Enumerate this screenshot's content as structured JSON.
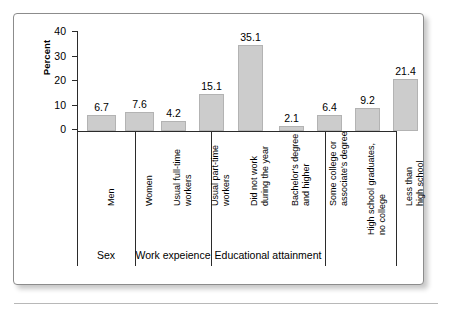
{
  "chart_data": {
    "type": "bar",
    "title": "",
    "xlabel": "",
    "ylabel": "Percent",
    "ylim": [
      0,
      40
    ],
    "yticks": [
      "0",
      "10",
      "20",
      "30",
      "40"
    ],
    "grid": false,
    "legend": "none",
    "categories": [
      "Men",
      "Women",
      "Usual full-time workers",
      "Usual part-time workers",
      "Did not work during the year",
      "Bachelor's degree and higher",
      "Some college or associate's degree",
      "High school graduates, no college",
      "Less than high school"
    ],
    "values": [
      6.7,
      7.6,
      4.2,
      15.1,
      35.1,
      2.1,
      6.4,
      9.2,
      21.4
    ],
    "bar_color": "#cccccc",
    "groups": [
      {
        "label": "Sex",
        "categories": [
          "Men",
          "Women"
        ]
      },
      {
        "label": "Work expeience",
        "categories": [
          "Usual full-time workers",
          "Usual part-time workers",
          "Did not work during the year"
        ]
      },
      {
        "label": "Educational attainment",
        "categories": [
          "Bachelor's degree and higher",
          "Some college or associate's degree",
          "High school graduates, no college",
          "Less than high school"
        ]
      }
    ]
  },
  "axis": {
    "y_title": "Percent",
    "ticks": [
      "40",
      "30",
      "20",
      "10",
      "0"
    ]
  },
  "bars": [
    {
      "value_label": "6.7",
      "line1": "Men",
      "line2": ""
    },
    {
      "value_label": "7.6",
      "line1": "Women",
      "line2": ""
    },
    {
      "value_label": "4.2",
      "line1": "Usual full-time",
      "line2": "workers"
    },
    {
      "value_label": "15.1",
      "line1": "Usual part-time",
      "line2": "workers"
    },
    {
      "value_label": "35.1",
      "line1": "Did not work",
      "line2": "during the year"
    },
    {
      "value_label": "2.1",
      "line1": "Bachelor's degree",
      "line2": "and higher"
    },
    {
      "value_label": "6.4",
      "line1": "Some college or",
      "line2": "associate's degree"
    },
    {
      "value_label": "9.2",
      "line1": "High school graduates,",
      "line2": "no college"
    },
    {
      "value_label": "21.4",
      "line1": "Less than",
      "line2": "high school"
    }
  ],
  "groups": [
    {
      "label": "Sex"
    },
    {
      "label": "Work expeience"
    },
    {
      "label": "Educational attainment"
    }
  ]
}
